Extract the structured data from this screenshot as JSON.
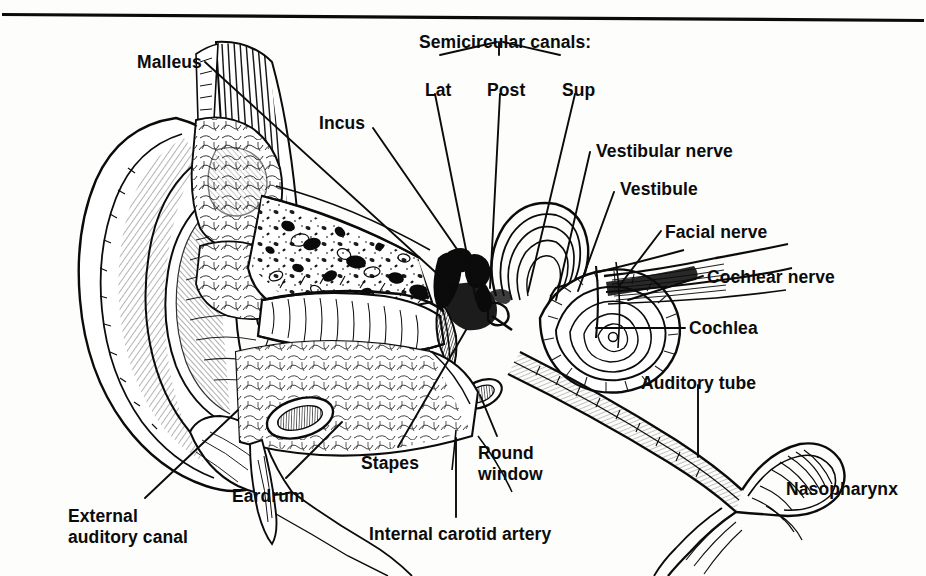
{
  "figure": {
    "type": "anatomical-line-illustration",
    "ink_color": "#0b0b0b",
    "background_color": "#fdfdfc",
    "top_rule": true
  },
  "group_labels": [
    {
      "id": "semicircular-canals",
      "text": "Semicircular canals:",
      "x": 419,
      "y": 32
    }
  ],
  "labels": [
    {
      "id": "malleus",
      "text": "Malleus",
      "x": 137,
      "y": 52,
      "align": "left"
    },
    {
      "id": "incus",
      "text": "Incus",
      "x": 319,
      "y": 113,
      "align": "left"
    },
    {
      "id": "lat",
      "text": "Lat",
      "x": 425,
      "y": 80,
      "align": "left"
    },
    {
      "id": "post",
      "text": "Post",
      "x": 487,
      "y": 80,
      "align": "left"
    },
    {
      "id": "sup",
      "text": "Sup",
      "x": 562,
      "y": 80,
      "align": "left"
    },
    {
      "id": "vestibular-nerve",
      "text": "Vestibular nerve",
      "x": 596,
      "y": 141,
      "align": "left"
    },
    {
      "id": "vestibule",
      "text": "Vestibule",
      "x": 620,
      "y": 179,
      "align": "left"
    },
    {
      "id": "facial-nerve",
      "text": "Facial nerve",
      "x": 665,
      "y": 222,
      "align": "left"
    },
    {
      "id": "cochlear-nerve",
      "text": "Cochlear nerve",
      "x": 707,
      "y": 267,
      "align": "left"
    },
    {
      "id": "cochlea",
      "text": "Cochlea",
      "x": 689,
      "y": 318,
      "align": "left"
    },
    {
      "id": "auditory-tube",
      "text": "Auditory tube",
      "x": 641,
      "y": 373,
      "align": "left"
    },
    {
      "id": "nasopharynx",
      "text": "Nasopharynx",
      "x": 786,
      "y": 479,
      "align": "left"
    },
    {
      "id": "round-window",
      "text": "Round\nwindow",
      "x": 478,
      "y": 443,
      "align": "left"
    },
    {
      "id": "stapes",
      "text": "Stapes",
      "x": 361,
      "y": 453,
      "align": "left"
    },
    {
      "id": "eardrum",
      "text": "Eardrum",
      "x": 232,
      "y": 486,
      "align": "left"
    },
    {
      "id": "external-auditory-canal",
      "text": "External\nauditory canal",
      "x": 68,
      "y": 506,
      "align": "left"
    },
    {
      "id": "internal-carotid-artery",
      "text": "Internal carotid artery",
      "x": 369,
      "y": 524,
      "align": "left"
    }
  ],
  "leader_lines": [
    {
      "id": "leader-malleus",
      "from": [
        205,
        62
      ],
      "to": [
        455,
        290
      ]
    },
    {
      "id": "leader-incus",
      "from": [
        373,
        128
      ],
      "to": [
        470,
        268
      ]
    },
    {
      "id": "leader-bracket-left",
      "from": [
        440,
        55
      ],
      "to": [
        497,
        42
      ]
    },
    {
      "id": "leader-bracket-mid",
      "from": [
        499,
        55
      ],
      "to": [
        499,
        42
      ]
    },
    {
      "id": "leader-bracket-right",
      "from": [
        560,
        55
      ],
      "to": [
        503,
        42
      ]
    },
    {
      "id": "leader-lat",
      "from": [
        435,
        94
      ],
      "to": [
        476,
        300
      ]
    },
    {
      "id": "leader-post",
      "from": [
        500,
        94
      ],
      "to": [
        490,
        288
      ]
    },
    {
      "id": "leader-sup",
      "from": [
        575,
        94
      ],
      "to": [
        528,
        292
      ]
    },
    {
      "id": "leader-vestibular-nerve",
      "from": [
        590,
        152
      ],
      "to": [
        556,
        300
      ]
    },
    {
      "id": "leader-vestibule",
      "from": [
        614,
        192
      ],
      "to": [
        578,
        291
      ]
    },
    {
      "id": "leader-facial-nerve",
      "from": [
        661,
        231
      ],
      "to": [
        620,
        285
      ]
    },
    {
      "id": "leader-cochlear-nerve",
      "from": [
        703,
        276
      ],
      "to": [
        628,
        300
      ]
    },
    {
      "id": "leader-cochlea",
      "from": [
        685,
        328
      ],
      "to": [
        596,
        328
      ]
    },
    {
      "id": "leader-auditory-tube",
      "from": [
        698,
        385
      ],
      "to": [
        698,
        457
      ]
    },
    {
      "id": "leader-round-window",
      "from": [
        497,
        436
      ],
      "to": [
        480,
        395
      ]
    },
    {
      "id": "leader-stapes",
      "from": [
        398,
        447
      ],
      "to": [
        466,
        330
      ]
    },
    {
      "id": "leader-eardrum",
      "from": [
        286,
        478
      ],
      "to": [
        342,
        422
      ]
    },
    {
      "id": "leader-external-auditory-canal",
      "from": [
        145,
        498
      ],
      "to": [
        238,
        410
      ]
    },
    {
      "id": "leader-internal-carotid-artery",
      "from": [
        456,
        517
      ],
      "to": [
        456,
        438
      ]
    }
  ],
  "structures": [
    "auricle-pinna",
    "external-auditory-canal",
    "tympanic-membrane",
    "malleus",
    "incus",
    "stapes",
    "mastoid-air-cells",
    "temporalis-muscle",
    "semicircular-canals",
    "vestibule",
    "cochlea",
    "vestibulocochlear-nerve",
    "facial-nerve",
    "round-window",
    "internal-carotid-artery",
    "auditory-tube",
    "nasopharynx"
  ]
}
